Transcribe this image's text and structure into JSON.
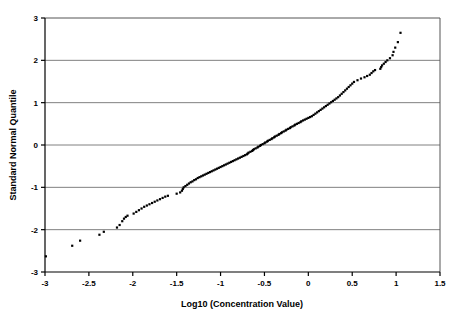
{
  "chart_data": {
    "type": "scatter",
    "title": "",
    "subtitle": "",
    "xlabel": "Log10 (Concentration Value)",
    "ylabel": "Standard Normal Quantile",
    "xlim": [
      -3,
      1.5
    ],
    "ylim": [
      -3,
      3
    ],
    "xticks": [
      -3,
      -2.5,
      -2,
      -1.5,
      -1,
      -0.5,
      0,
      0.5,
      1,
      1.5
    ],
    "xticklabels": [
      "-3",
      "-2.5",
      "-2",
      "-1.5",
      "-1",
      "-0.5",
      "0",
      "0.5",
      "1",
      "1.5"
    ],
    "yticks": [
      -3,
      -2,
      -1,
      0,
      1,
      2,
      3
    ],
    "yticklabels": [
      "-3",
      "-2",
      "-1",
      "0",
      "1",
      "2",
      "3"
    ],
    "grid": {
      "horizontal": true,
      "vertical": false,
      "color": "#808080"
    },
    "legend": {
      "visible": false,
      "position": "none"
    },
    "marker": {
      "shape": "square",
      "size": 2.2,
      "color": "#000000"
    },
    "series": [
      {
        "name": "Normal Q-Q",
        "points": [
          [
            -2.99,
            -2.63
          ],
          [
            -2.69,
            -2.38
          ],
          [
            -2.6,
            -2.26
          ],
          [
            -2.38,
            -2.12
          ],
          [
            -2.33,
            -2.05
          ],
          [
            -2.18,
            -1.95
          ],
          [
            -2.15,
            -1.89
          ],
          [
            -2.12,
            -1.8
          ],
          [
            -2.1,
            -1.74
          ],
          [
            -2.08,
            -1.7
          ],
          [
            -2.06,
            -1.67
          ],
          [
            -1.99,
            -1.62
          ],
          [
            -1.96,
            -1.58
          ],
          [
            -1.93,
            -1.54
          ],
          [
            -1.9,
            -1.5
          ],
          [
            -1.87,
            -1.46
          ],
          [
            -1.84,
            -1.43
          ],
          [
            -1.81,
            -1.4
          ],
          [
            -1.78,
            -1.37
          ],
          [
            -1.75,
            -1.34
          ],
          [
            -1.72,
            -1.31
          ],
          [
            -1.69,
            -1.28
          ],
          [
            -1.66,
            -1.25
          ],
          [
            -1.63,
            -1.22
          ],
          [
            -1.6,
            -1.2
          ],
          [
            -1.5,
            -1.15
          ],
          [
            -1.46,
            -1.12
          ],
          [
            -1.44,
            -1.08
          ],
          [
            -1.43,
            -1.04
          ],
          [
            -1.42,
            -1.0
          ],
          [
            -1.4,
            -0.97
          ],
          [
            -1.38,
            -0.94
          ],
          [
            -1.36,
            -0.91
          ],
          [
            -1.34,
            -0.88
          ],
          [
            -1.32,
            -0.86
          ],
          [
            -1.3,
            -0.83
          ],
          [
            -1.28,
            -0.81
          ],
          [
            -1.26,
            -0.78
          ],
          [
            -1.24,
            -0.76
          ],
          [
            -1.22,
            -0.74
          ],
          [
            -1.2,
            -0.72
          ],
          [
            -1.18,
            -0.7
          ],
          [
            -1.16,
            -0.68
          ],
          [
            -1.14,
            -0.66
          ],
          [
            -1.12,
            -0.64
          ],
          [
            -1.1,
            -0.62
          ],
          [
            -1.08,
            -0.6
          ],
          [
            -1.06,
            -0.58
          ],
          [
            -1.04,
            -0.56
          ],
          [
            -1.02,
            -0.54
          ],
          [
            -1.0,
            -0.52
          ],
          [
            -0.98,
            -0.5
          ],
          [
            -0.96,
            -0.48
          ],
          [
            -0.94,
            -0.46
          ],
          [
            -0.92,
            -0.44
          ],
          [
            -0.9,
            -0.42
          ],
          [
            -0.88,
            -0.4
          ],
          [
            -0.86,
            -0.38
          ],
          [
            -0.84,
            -0.36
          ],
          [
            -0.82,
            -0.34
          ],
          [
            -0.8,
            -0.32
          ],
          [
            -0.78,
            -0.3
          ],
          [
            -0.76,
            -0.28
          ],
          [
            -0.74,
            -0.26
          ],
          [
            -0.72,
            -0.24
          ],
          [
            -0.7,
            -0.22
          ],
          [
            -0.69,
            -0.2
          ],
          [
            -0.68,
            -0.18
          ],
          [
            -0.66,
            -0.16
          ],
          [
            -0.64,
            -0.14
          ],
          [
            -0.63,
            -0.12
          ],
          [
            -0.62,
            -0.1
          ],
          [
            -0.6,
            -0.08
          ],
          [
            -0.58,
            -0.06
          ],
          [
            -0.57,
            -0.04
          ],
          [
            -0.55,
            -0.02
          ],
          [
            -0.54,
            0.0
          ],
          [
            -0.52,
            0.02
          ],
          [
            -0.5,
            0.04
          ],
          [
            -0.49,
            0.06
          ],
          [
            -0.47,
            0.08
          ],
          [
            -0.46,
            0.1
          ],
          [
            -0.44,
            0.12
          ],
          [
            -0.42,
            0.14
          ],
          [
            -0.41,
            0.16
          ],
          [
            -0.39,
            0.18
          ],
          [
            -0.38,
            0.2
          ],
          [
            -0.36,
            0.22
          ],
          [
            -0.34,
            0.24
          ],
          [
            -0.33,
            0.26
          ],
          [
            -0.31,
            0.28
          ],
          [
            -0.3,
            0.3
          ],
          [
            -0.28,
            0.32
          ],
          [
            -0.26,
            0.34
          ],
          [
            -0.25,
            0.36
          ],
          [
            -0.23,
            0.38
          ],
          [
            -0.21,
            0.4
          ],
          [
            -0.2,
            0.42
          ],
          [
            -0.18,
            0.44
          ],
          [
            -0.16,
            0.46
          ],
          [
            -0.15,
            0.48
          ],
          [
            -0.13,
            0.5
          ],
          [
            -0.11,
            0.52
          ],
          [
            -0.09,
            0.54
          ],
          [
            -0.08,
            0.56
          ],
          [
            -0.06,
            0.58
          ],
          [
            -0.04,
            0.6
          ],
          [
            -0.02,
            0.62
          ],
          [
            0.0,
            0.64
          ],
          [
            0.02,
            0.66
          ],
          [
            0.04,
            0.68
          ],
          [
            0.06,
            0.71
          ],
          [
            0.08,
            0.74
          ],
          [
            0.1,
            0.77
          ],
          [
            0.12,
            0.8
          ],
          [
            0.14,
            0.83
          ],
          [
            0.16,
            0.86
          ],
          [
            0.18,
            0.89
          ],
          [
            0.2,
            0.92
          ],
          [
            0.22,
            0.95
          ],
          [
            0.24,
            0.98
          ],
          [
            0.26,
            1.01
          ],
          [
            0.28,
            1.04
          ],
          [
            0.3,
            1.07
          ],
          [
            0.32,
            1.1
          ],
          [
            0.34,
            1.13
          ],
          [
            0.36,
            1.17
          ],
          [
            0.38,
            1.21
          ],
          [
            0.4,
            1.25
          ],
          [
            0.42,
            1.29
          ],
          [
            0.44,
            1.33
          ],
          [
            0.46,
            1.37
          ],
          [
            0.48,
            1.41
          ],
          [
            0.5,
            1.45
          ],
          [
            0.52,
            1.49
          ],
          [
            0.56,
            1.53
          ],
          [
            0.6,
            1.57
          ],
          [
            0.64,
            1.6
          ],
          [
            0.67,
            1.63
          ],
          [
            0.7,
            1.66
          ],
          [
            0.72,
            1.7
          ],
          [
            0.74,
            1.74
          ],
          [
            0.76,
            1.77
          ],
          [
            0.82,
            1.8
          ],
          [
            0.83,
            1.84
          ],
          [
            0.84,
            1.88
          ],
          [
            0.86,
            1.92
          ],
          [
            0.88,
            1.96
          ],
          [
            0.9,
            2.0
          ],
          [
            0.93,
            2.05
          ],
          [
            0.96,
            2.12
          ],
          [
            0.97,
            2.2
          ],
          [
            0.99,
            2.3
          ],
          [
            1.02,
            2.43
          ],
          [
            1.05,
            2.65
          ]
        ]
      }
    ]
  },
  "axes": {
    "plot_left": 45,
    "plot_right": 440,
    "plot_top": 18,
    "plot_bottom": 272
  }
}
